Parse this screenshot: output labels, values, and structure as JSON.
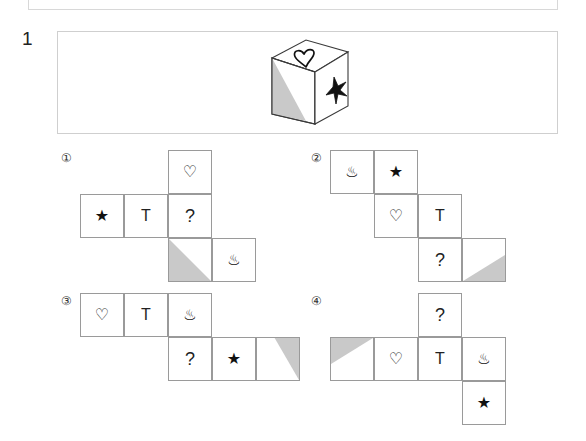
{
  "question": {
    "number": "1",
    "stem": {
      "figure_name": "cube",
      "faces": {
        "top": "♡",
        "right": "★",
        "front": "shaded-triangle-bottom-left"
      }
    }
  },
  "glyphs": {
    "heart": "♡",
    "star": "★",
    "onsen": "♨",
    "letter_t": "T",
    "question_mark": "?"
  },
  "colors": {
    "shade_fill": "#c9c9c9",
    "cell_border": "#9a9a9a",
    "panel_border": "#cfcfcf",
    "ink": "#111111"
  },
  "options": [
    {
      "label": "①",
      "name": "option-1",
      "cells": [
        {
          "col": 2,
          "row": 0,
          "glyph": "♡",
          "kind": "heart"
        },
        {
          "col": 0,
          "row": 1,
          "glyph": "★",
          "kind": "star"
        },
        {
          "col": 1,
          "row": 1,
          "glyph": "T",
          "kind": "letter"
        },
        {
          "col": 2,
          "row": 1,
          "glyph": "?",
          "kind": "qmark"
        },
        {
          "col": 2,
          "row": 2,
          "glyph": "",
          "kind": "shade",
          "shade": "bottom-left"
        },
        {
          "col": 3,
          "row": 2,
          "glyph": "♨",
          "kind": "onsen"
        }
      ]
    },
    {
      "label": "②",
      "name": "option-2",
      "cells": [
        {
          "col": 0,
          "row": 0,
          "glyph": "♨",
          "kind": "onsen"
        },
        {
          "col": 1,
          "row": 0,
          "glyph": "★",
          "kind": "star"
        },
        {
          "col": 1,
          "row": 1,
          "glyph": "♡",
          "kind": "heart"
        },
        {
          "col": 2,
          "row": 1,
          "glyph": "T",
          "kind": "letter"
        },
        {
          "col": 2,
          "row": 2,
          "glyph": "?",
          "kind": "qmark"
        },
        {
          "col": 3,
          "row": 2,
          "glyph": "",
          "kind": "shade",
          "shade": "bottom-right"
        }
      ]
    },
    {
      "label": "③",
      "name": "option-3",
      "cells": [
        {
          "col": 0,
          "row": 0,
          "glyph": "♡",
          "kind": "heart"
        },
        {
          "col": 1,
          "row": 0,
          "glyph": "T",
          "kind": "letter"
        },
        {
          "col": 2,
          "row": 0,
          "glyph": "♨",
          "kind": "onsen"
        },
        {
          "col": 2,
          "row": 1,
          "glyph": "?",
          "kind": "qmark"
        },
        {
          "col": 3,
          "row": 1,
          "glyph": "★",
          "kind": "star"
        },
        {
          "col": 4,
          "row": 1,
          "glyph": "",
          "kind": "shade",
          "shade": "top-right"
        }
      ]
    },
    {
      "label": "④",
      "name": "option-4",
      "cells": [
        {
          "col": 2,
          "row": 0,
          "glyph": "?",
          "kind": "qmark"
        },
        {
          "col": 0,
          "row": 1,
          "glyph": "",
          "kind": "shade",
          "shade": "top-left"
        },
        {
          "col": 1,
          "row": 1,
          "glyph": "♡",
          "kind": "heart"
        },
        {
          "col": 2,
          "row": 1,
          "glyph": "T",
          "kind": "letter"
        },
        {
          "col": 3,
          "row": 1,
          "glyph": "♨",
          "kind": "onsen"
        },
        {
          "col": 3,
          "row": 2,
          "glyph": "★",
          "kind": "star"
        }
      ]
    }
  ],
  "layout": {
    "cell_size": 44,
    "option_origins": [
      {
        "x": 80,
        "y": 150
      },
      {
        "x": 330,
        "y": 150
      },
      {
        "x": 80,
        "y": 293
      },
      {
        "x": 330,
        "y": 293
      }
    ],
    "option_label_positions": [
      {
        "x": 58,
        "y": 150
      },
      {
        "x": 308,
        "y": 150
      },
      {
        "x": 58,
        "y": 293
      },
      {
        "x": 308,
        "y": 293
      }
    ]
  }
}
